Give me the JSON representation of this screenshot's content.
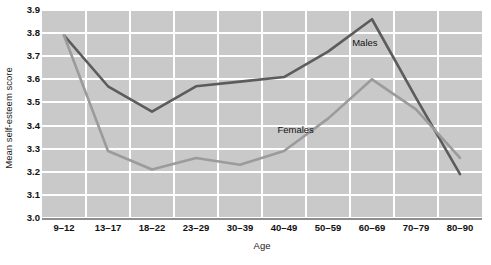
{
  "chart_data": {
    "type": "line",
    "title": "",
    "xlabel": "Age",
    "ylabel": "Mean self-esteem score",
    "categories": [
      "9–12",
      "13–17",
      "18–22",
      "23–29",
      "30–39",
      "40–49",
      "50–59",
      "60–69",
      "70–79",
      "80–90"
    ],
    "ylim": [
      3.0,
      3.9
    ],
    "yticks": [
      "3.0",
      "3.1",
      "3.2",
      "3.3",
      "3.4",
      "3.5",
      "3.6",
      "3.7",
      "3.8",
      "3.9"
    ],
    "ytick_values": [
      3.0,
      3.1,
      3.2,
      3.3,
      3.4,
      3.5,
      3.6,
      3.7,
      3.8,
      3.9
    ],
    "grid": true,
    "legend_position": "inline-annotations",
    "series": [
      {
        "name": "Males",
        "color": "#5c5c5c",
        "values": [
          3.79,
          3.57,
          3.46,
          3.57,
          3.59,
          3.61,
          3.72,
          3.86,
          3.52,
          3.19
        ]
      },
      {
        "name": "Females",
        "color": "#9b9b9b",
        "values": [
          3.79,
          3.29,
          3.21,
          3.26,
          3.23,
          3.29,
          3.43,
          3.6,
          3.47,
          3.26
        ]
      }
    ],
    "annotations": [
      {
        "text": "Males",
        "x_pct": 70.5,
        "y_pct": 13.0
      },
      {
        "text": "Females",
        "x_pct": 53.5,
        "y_pct": 55.0
      }
    ]
  },
  "style": {
    "plot_background": "#c9c9c9",
    "gridline_color": "#ffffff",
    "axis_color": "#8e8e8e",
    "text_color": "#111111"
  }
}
